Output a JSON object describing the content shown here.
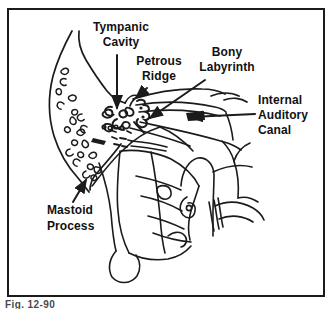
{
  "figure": {
    "caption": "Fig. 12-90",
    "labels": {
      "tympanic_cavity": "Tympanic\nCavity",
      "petrous_ridge": "Petrous\nRidge",
      "bony_labyrinth": "Bony\nLabyrinth",
      "internal_auditory_canal": "Internal\nAuditory\nCanal",
      "mastoid_process": "Mastoid\nProcess"
    },
    "colors": {
      "line": "#1b1b1b",
      "background": "#ffffff",
      "border": "#1b1b1b"
    }
  }
}
